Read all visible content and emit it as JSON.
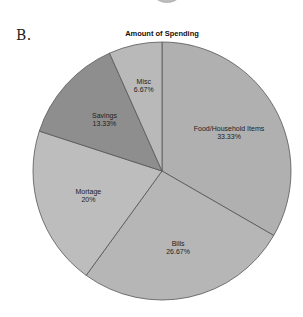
{
  "panel": {
    "label": "B."
  },
  "chart_data": {
    "type": "pie",
    "title": "Amount of Spending",
    "start_angle_deg": 0,
    "direction": "clockwise",
    "legend": "none",
    "categories": [
      "Food/Household Items",
      "Bills",
      "Mortage",
      "Savings",
      "Misc"
    ],
    "values": [
      33.33,
      26.67,
      20,
      13.33,
      6.67
    ],
    "value_labels": [
      "33.33%",
      "26.67%",
      "20%",
      "13.33%",
      "6.67%"
    ],
    "colors": [
      "#b0b0b0",
      "#b6b6b6",
      "#bdbdbd",
      "#8e8e8e",
      "#b9b9b9"
    ],
    "edge_color": "#555555"
  }
}
